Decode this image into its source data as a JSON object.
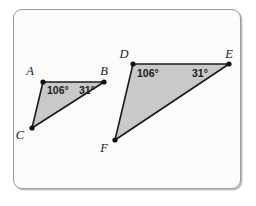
{
  "figure": {
    "kind": "similar-triangles-diagram",
    "frame": {
      "background_color": "#fbfbfb",
      "border_color": "#9a9a9a",
      "corner_radius_px": 9
    },
    "style": {
      "triangle_fill_color": "#c9c9c9",
      "triangle_stroke_color": "#1a1a1a",
      "vertex_dot_color": "#111111",
      "label_color": "#1a1a1a"
    },
    "triangles": [
      {
        "id": "triangle-abc",
        "name": "Triangle ABC",
        "vertices": [
          {
            "label": "A",
            "x": 43,
            "y": 82,
            "label_x": 30,
            "label_y": 75
          },
          {
            "label": "B",
            "x": 104,
            "y": 82,
            "label_x": 104,
            "label_y": 75
          },
          {
            "label": "C",
            "x": 32,
            "y": 128,
            "label_x": 20,
            "label_y": 139
          }
        ],
        "angle_labels": [
          {
            "at_vertex": "A",
            "text": "106°",
            "x": 47,
            "y": 94
          },
          {
            "at_vertex": "B",
            "text": "31°",
            "x": 79,
            "y": 94
          }
        ]
      },
      {
        "id": "triangle-def",
        "name": "Triangle DEF",
        "vertices": [
          {
            "label": "D",
            "x": 133,
            "y": 64,
            "label_x": 124,
            "label_y": 58
          },
          {
            "label": "E",
            "x": 229,
            "y": 64,
            "label_x": 229,
            "label_y": 58
          },
          {
            "label": "F",
            "x": 115,
            "y": 140,
            "label_x": 104,
            "label_y": 152
          }
        ],
        "angle_labels": [
          {
            "at_vertex": "D",
            "text": "106°",
            "x": 137,
            "y": 77
          },
          {
            "at_vertex": "E",
            "text": "31°",
            "x": 192,
            "y": 77
          }
        ]
      }
    ]
  }
}
